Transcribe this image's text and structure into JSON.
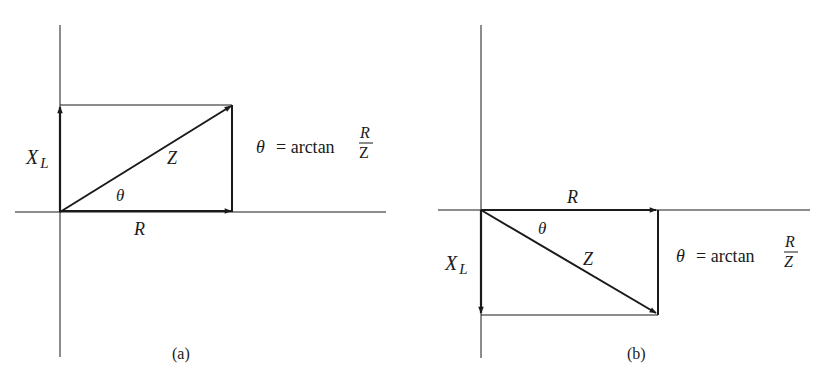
{
  "diagrams": [
    {
      "id": "a",
      "caption": "(a)",
      "vectors": {
        "xl": {
          "label": "X",
          "sub": "L",
          "direction": "up"
        },
        "r": {
          "label": "R",
          "direction": "right"
        },
        "z": {
          "label": "Z",
          "direction": "up-right"
        }
      },
      "angle_label": "θ",
      "formula": {
        "lhs": "θ",
        "eq": "= arctan",
        "num": "R",
        "den": "Z"
      }
    },
    {
      "id": "b",
      "caption": "(b)",
      "vectors": {
        "xl": {
          "label": "X",
          "sub": "L",
          "direction": "down"
        },
        "r": {
          "label": "R",
          "direction": "right"
        },
        "z": {
          "label": "Z",
          "direction": "down-right"
        }
      },
      "angle_label": "θ",
      "formula": {
        "lhs": "θ",
        "eq": "= arctan",
        "num": "R",
        "den": "Z"
      }
    }
  ],
  "colors": {
    "ink": "#1a1a1a",
    "background": "#ffffff"
  }
}
